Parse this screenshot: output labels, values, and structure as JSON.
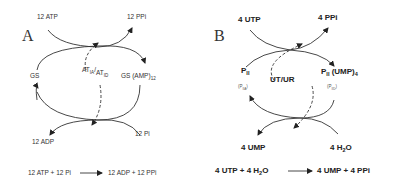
{
  "panel_a": {
    "letter": "A",
    "top_left": "12 ATP",
    "top_right": "12 PPi",
    "left": "GS",
    "right_main": "GS (AMP)",
    "right_sub": "12",
    "center_at1": "AT",
    "center_at1_sub": "IA",
    "center_sep": "/",
    "center_at2": "AT",
    "center_at2_sub": "ID",
    "bottom_left": "12 ADP",
    "bottom_right": "12 Pi",
    "eq_left": "12 ATP + 12 Pi",
    "eq_right": "12 ADP + 12 PPi"
  },
  "panel_b": {
    "letter": "B",
    "top_left": "4 UTP",
    "top_right": "4 PPi",
    "left_main": "P",
    "left_sub": "II",
    "left_tiny": "(P",
    "left_tiny_sub": "IIA",
    "left_tiny_end": ")",
    "right_main": "P",
    "right_sub": "II",
    "right_rest": " (UMP)",
    "right_rest_sub": "4",
    "right_tiny": "(P",
    "right_tiny_sub": "IID",
    "right_tiny_end": ")",
    "center": "UT/UR",
    "bottom_left": "4 UMP",
    "bottom_right_main": "4 H",
    "bottom_right_sub": "2",
    "bottom_right_end": "O",
    "eq_left_a": "4 UTP + 4 H",
    "eq_left_sub": "2",
    "eq_left_b": "O",
    "eq_right": "4 UMP + 4 PPi"
  }
}
